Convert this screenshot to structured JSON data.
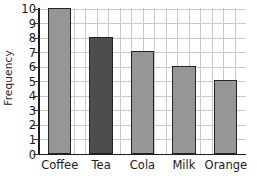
{
  "chart_data": {
    "type": "bar",
    "title": "",
    "xlabel": "",
    "ylabel": "Frequency",
    "categories": [
      "Coffee",
      "Tea",
      "Cola",
      "Milk",
      "Orange"
    ],
    "values": [
      10,
      8,
      7,
      6,
      5
    ],
    "series": [
      {
        "name": "Frequency",
        "values": [
          10,
          8,
          7,
          6,
          5
        ]
      }
    ],
    "ylim": [
      0,
      10
    ],
    "ytick_labels": [
      "0",
      "1",
      "2",
      "3",
      "4",
      "5",
      "6",
      "7",
      "8",
      "9",
      "10"
    ],
    "ytick_values": [
      0,
      1,
      2,
      3,
      4,
      5,
      6,
      7,
      8,
      9,
      10
    ],
    "grid": true,
    "legend": "none",
    "bar_colors": [
      "#969696",
      "#4d4d4d",
      "#969696",
      "#969696",
      "#969696"
    ],
    "bar_edge_color": "#242424",
    "grid_color": "#c9c9c9",
    "axis_color": "#1c1c1c"
  }
}
